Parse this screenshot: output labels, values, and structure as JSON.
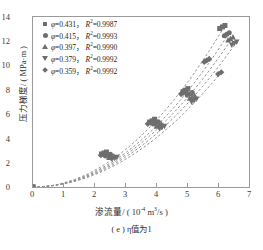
{
  "chart_data": {
    "type": "scatter",
    "title": "",
    "xlabel": "渗流量/ ( 10⁻⁴ m³/s )",
    "ylabel": "压力梯度/ ( MPa·m )",
    "caption": "( e ) η值为1",
    "xlim": [
      0,
      7
    ],
    "ylim": [
      0,
      14
    ],
    "xticks": [
      0,
      1,
      2,
      3,
      4,
      5,
      6,
      7
    ],
    "yticks": [
      0,
      2,
      4,
      6,
      8,
      10,
      12,
      14
    ],
    "grid": false,
    "legend_position": "upper-left",
    "marker_color": "#6e6e6e",
    "line_color": "#8f8f8f",
    "line_style": "dashed",
    "axis_color": "#9a9a9a",
    "series": [
      {
        "name": "φ=0.431, R²=0.9987",
        "phi": 0.431,
        "r2": 0.9987,
        "marker": "square",
        "x": [
          0.0,
          2.22,
          2.3,
          2.38,
          3.78,
          3.86,
          3.94,
          4.86,
          4.94,
          5.02,
          6.05,
          6.14,
          6.22
        ],
        "y": [
          0.0,
          2.72,
          2.8,
          2.88,
          5.35,
          5.45,
          5.58,
          7.85,
          7.97,
          8.1,
          13.05,
          13.18,
          13.3
        ]
      },
      {
        "name": "φ=0.415, R²=0.9993",
        "phi": 0.415,
        "r2": 0.9993,
        "marker": "circle",
        "x": [
          0.0,
          2.35,
          2.43,
          2.51,
          3.9,
          3.98,
          4.06,
          5.0,
          5.08,
          5.16,
          6.2,
          6.28,
          6.36
        ],
        "y": [
          0.0,
          2.55,
          2.62,
          2.7,
          5.18,
          5.28,
          5.38,
          7.55,
          7.66,
          7.78,
          12.45,
          12.58,
          12.7
        ]
      },
      {
        "name": "φ=0.397, R²=0.9990",
        "phi": 0.397,
        "r2": 0.999,
        "marker": "triangle-up",
        "x": [
          0.0,
          2.46,
          2.54,
          2.62,
          4.0,
          4.08,
          4.16,
          5.08,
          5.16,
          5.24,
          6.32,
          6.4,
          6.48
        ],
        "y": [
          0.0,
          2.42,
          2.49,
          2.56,
          5.0,
          5.1,
          5.2,
          7.3,
          7.42,
          7.54,
          12.1,
          12.22,
          12.35
        ]
      },
      {
        "name": "φ=0.379, R²=0.9992",
        "phi": 0.379,
        "r2": 0.9992,
        "marker": "triangle-down",
        "x": [
          0.0,
          2.56,
          2.64,
          2.72,
          4.1,
          4.18,
          4.26,
          5.14,
          5.22,
          5.3,
          6.44,
          6.52,
          6.6
        ],
        "y": [
          0.0,
          2.3,
          2.37,
          2.44,
          4.8,
          4.9,
          5.0,
          7.0,
          7.12,
          7.24,
          11.7,
          11.82,
          11.95
        ]
      },
      {
        "name": "φ=0.359, R²=0.9992",
        "phi": 0.359,
        "r2": 0.9992,
        "marker": "diamond",
        "x": [
          0.0,
          2.2,
          2.28,
          2.36,
          3.72,
          3.8,
          3.88,
          4.8,
          4.88,
          4.96,
          5.55,
          5.63,
          5.71,
          6.0,
          6.1
        ],
        "y": [
          0.0,
          2.62,
          2.7,
          2.78,
          5.2,
          5.3,
          5.42,
          7.65,
          7.78,
          7.9,
          10.3,
          10.42,
          10.55,
          9.3,
          9.45
        ]
      }
    ]
  },
  "axes": {
    "y_ticks": [
      "0",
      "2",
      "4",
      "6",
      "8",
      "10",
      "12",
      "14"
    ],
    "x_ticks": [
      "0",
      "1",
      "2",
      "3",
      "4",
      "5",
      "6",
      "7"
    ],
    "ylabel_main": "压力梯度/ ( MPa·m )",
    "xlabel_pre": "渗流量/ ( 10",
    "xlabel_sup": "-4",
    "xlabel_mid": " m",
    "xlabel_sup2": "3",
    "xlabel_post": "/s )",
    "caption": "( e ) η值为1"
  },
  "legend": {
    "items": [
      {
        "marker": "square",
        "phi_symbol": "φ",
        "phi_value": "=0.431，",
        "r2_symbol": "R",
        "r2_sup": "2",
        "r2_value": "=0.9987"
      },
      {
        "marker": "circle",
        "phi_symbol": "φ",
        "phi_value": "=0.415，",
        "r2_symbol": "R",
        "r2_sup": "2",
        "r2_value": "=0.9993"
      },
      {
        "marker": "triangle-up",
        "phi_symbol": "φ",
        "phi_value": "=0.397，",
        "r2_symbol": "R",
        "r2_sup": "2",
        "r2_value": "=0.9990"
      },
      {
        "marker": "triangle-down",
        "phi_symbol": "φ",
        "phi_value": "=0.379，",
        "r2_symbol": "R",
        "r2_sup": "2",
        "r2_value": "=0.9992"
      },
      {
        "marker": "diamond",
        "phi_symbol": "φ",
        "phi_value": "=0.359，",
        "r2_symbol": "R",
        "r2_sup": "2",
        "r2_value": "=0.9992"
      }
    ]
  }
}
